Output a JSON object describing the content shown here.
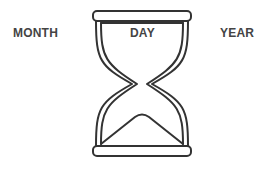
{
  "labels": {
    "month": "MONTH",
    "day": "DAY",
    "year": "YEAR"
  },
  "icon": "hourglass-icon",
  "colors": {
    "stroke": "#333333",
    "text": "#444444",
    "background": "#ffffff"
  }
}
